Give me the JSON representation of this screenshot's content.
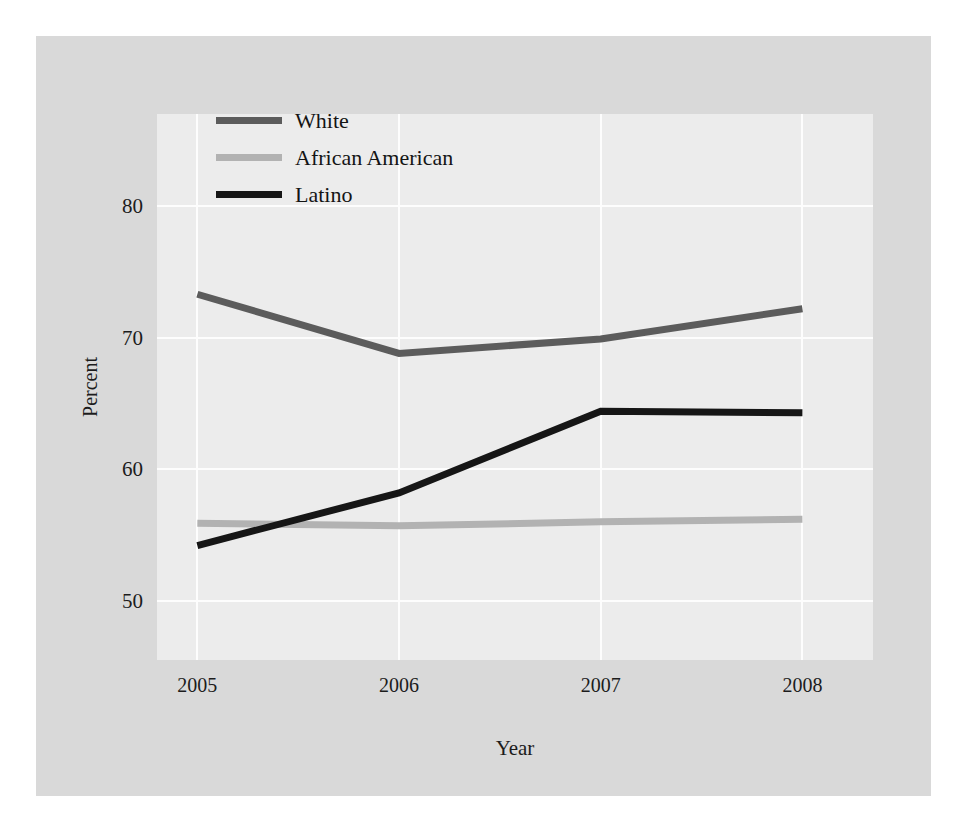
{
  "chart_data": {
    "type": "line",
    "title": "",
    "xlabel": "Year",
    "ylabel": "Percent",
    "x": [
      2005,
      2006,
      2007,
      2008
    ],
    "xticklabels": [
      "2005",
      "2006",
      "2007",
      "2008"
    ],
    "yticks": [
      50,
      60,
      70,
      80
    ],
    "yticklabels": [
      "50",
      "60",
      "70",
      "80"
    ],
    "ylim": [
      45.5,
      87.0
    ],
    "xlim": [
      2004.8,
      2008.35
    ],
    "grid": true,
    "grid_color": "#fdfdfd",
    "legend_position": "upper-center-left",
    "plot_background": "#ececec",
    "figure_background": "#d9d9d9",
    "series": [
      {
        "name": "White",
        "color": "#5c5c5c",
        "values": [
          73.3,
          68.8,
          69.9,
          72.2
        ]
      },
      {
        "name": "African American",
        "color": "#b2b2b2",
        "values": [
          55.9,
          55.7,
          56.0,
          56.2
        ]
      },
      {
        "name": "Latino",
        "color": "#161616",
        "values": [
          54.2,
          58.2,
          64.4,
          64.3
        ]
      }
    ]
  },
  "legend": {
    "entries": [
      {
        "label": "White",
        "color": "#5c5c5c"
      },
      {
        "label": "African American",
        "color": "#b2b2b2"
      },
      {
        "label": "Latino",
        "color": "#161616"
      }
    ]
  }
}
